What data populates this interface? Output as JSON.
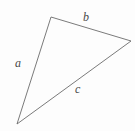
{
  "figure": {
    "background_color": "#fdfdfd",
    "stroke_color": "#6b6b6b",
    "stroke_width": 0.9,
    "label_color": "#4a4a4a",
    "canvas": {
      "width": 135,
      "height": 131
    }
  },
  "chart_data": {
    "type": "diagram",
    "shape": "triangle",
    "vertices": [
      {
        "name": "apex",
        "x": 51,
        "y": 17
      },
      {
        "name": "right",
        "x": 131,
        "y": 41
      },
      {
        "name": "bottom-left",
        "x": 17,
        "y": 124
      }
    ],
    "edges": [
      {
        "label": "a",
        "from": "apex",
        "to": "bottom-left"
      },
      {
        "label": "b",
        "from": "apex",
        "to": "right"
      },
      {
        "label": "c",
        "from": "right",
        "to": "bottom-left"
      }
    ],
    "polygon_points": "51,17 131,41 17,124"
  },
  "labels": {
    "a": "a",
    "b": "b",
    "c": "c"
  }
}
